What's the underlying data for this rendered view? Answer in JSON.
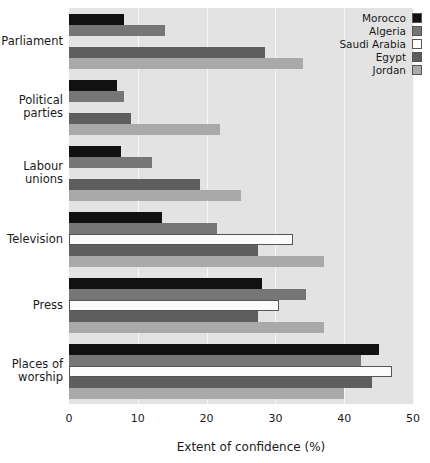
{
  "chart_data": {
    "type": "bar",
    "orientation": "horizontal",
    "title": "",
    "xlabel": "Extent of confidence (%)",
    "ylabel": "",
    "xlim": [
      0,
      50
    ],
    "xticks": [
      0,
      10,
      20,
      30,
      40,
      50
    ],
    "xtick_labels": [
      "0",
      "10",
      "20",
      "30",
      "40",
      "50"
    ],
    "grid": true,
    "grid_axis": "x",
    "legend_position": "top-right",
    "categories": [
      "Parliament",
      "Political parties",
      "Labour unions",
      "Television",
      "Press",
      "Places of worship"
    ],
    "series": [
      {
        "name": "Morocco",
        "color": "#111111",
        "values": [
          8.0,
          7.0,
          7.5,
          13.5,
          28.0,
          45.0
        ]
      },
      {
        "name": "Algeria",
        "color": "#767676",
        "values": [
          14.0,
          8.0,
          12.0,
          21.5,
          34.5,
          42.5
        ]
      },
      {
        "name": "Saudi Arabia",
        "color": "#fbfbfb",
        "values": [
          0.0,
          0.0,
          0.0,
          32.5,
          30.5,
          47.0
        ]
      },
      {
        "name": "Egypt",
        "color": "#5e5e5e",
        "values": [
          28.5,
          9.0,
          19.0,
          27.5,
          27.5,
          44.0
        ]
      },
      {
        "name": "Jordan",
        "color": "#a9a9a9",
        "values": [
          34.0,
          22.0,
          25.0,
          37.0,
          37.0,
          40.0
        ]
      }
    ]
  },
  "legend": {
    "items": [
      {
        "label": "Morocco"
      },
      {
        "label": "Algeria"
      },
      {
        "label": "Saudi Arabia"
      },
      {
        "label": "Egypt"
      },
      {
        "label": "Jordan"
      }
    ]
  },
  "axis": {
    "x_label": "Extent of confidence (%)"
  }
}
